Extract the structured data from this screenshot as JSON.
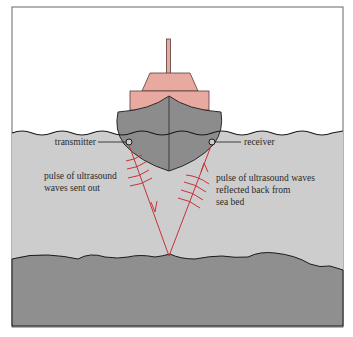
{
  "diagram": {
    "labels": {
      "transmitter": "transmitter",
      "receiver": "receiver",
      "sent_line1": "pulse of ultrasound",
      "sent_line2": "waves sent out",
      "reflected_line1": "pulse of ultrasound waves",
      "reflected_line2": "reflected back from",
      "reflected_line3": "sea bed"
    },
    "colors": {
      "frame": "#555555",
      "sky": "#ffffff",
      "water": "#cdcdcd",
      "sea_bed": "#8f8f8f",
      "hull": "#8c8c8c",
      "superstructure": "#e8a9a0",
      "outline": "#3a2a2a",
      "wave_ray": "#c8323a"
    }
  }
}
